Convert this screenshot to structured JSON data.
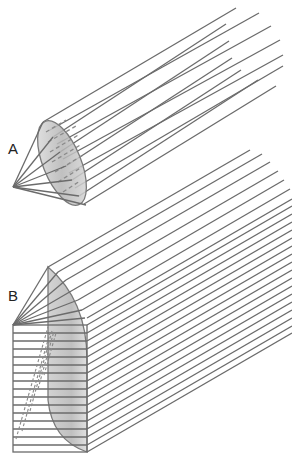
{
  "figure": {
    "panels": [
      {
        "label": "A",
        "description": "Cone of rays converging from a disk-shaped (elliptical) aperture to a single apex point, with parallel rays extending up-right"
      },
      {
        "label": "B",
        "description": "Fan of rays from apex to a half-dome shaded surface above a stacked rectangular block with horizontal rows and dashed hatching, parallel rays extending up-right"
      }
    ],
    "colors": {
      "line": "#6b6b6b",
      "shade_light": "#e2e2e2",
      "shade_dark": "#a9a9a9",
      "background": "#ffffff"
    }
  }
}
